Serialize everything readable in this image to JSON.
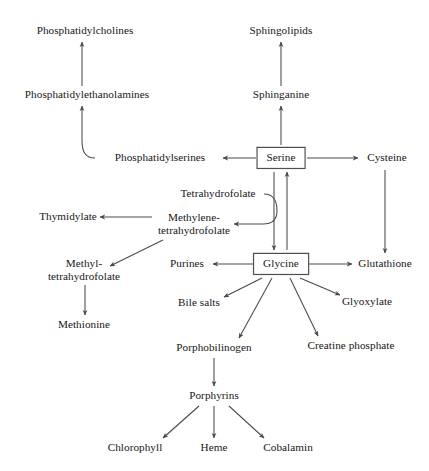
{
  "diagram": {
    "type": "flowchart",
    "width": 429,
    "height": 471,
    "background_color": "#ffffff",
    "text_color": "#161616",
    "edge_color": "#4a4a4a",
    "box_border_color": "#3b3b3b",
    "nodes": [
      {
        "id": "phosphatidylcholines",
        "label": "Phosphatidylcholines",
        "x": 85,
        "y": 31,
        "boxed": false
      },
      {
        "id": "sphingolipids",
        "label": "Sphingolipids",
        "x": 281,
        "y": 31,
        "boxed": false
      },
      {
        "id": "phosphatidylethanolamines",
        "label": "Phosphatidylethanolamines",
        "x": 87,
        "y": 95,
        "boxed": false
      },
      {
        "id": "sphinganine",
        "label": "Sphinganine",
        "x": 281,
        "y": 95,
        "boxed": false
      },
      {
        "id": "phosphatidylserines",
        "label": "Phosphatidylserines",
        "x": 160,
        "y": 158,
        "boxed": false
      },
      {
        "id": "serine",
        "label": "Serine",
        "x": 281,
        "y": 158,
        "boxed": true
      },
      {
        "id": "cysteine",
        "label": "Cysteine",
        "x": 387,
        "y": 158,
        "boxed": false
      },
      {
        "id": "tetrahydrofolate",
        "label": "Tetrahydrofolate",
        "x": 218,
        "y": 194,
        "boxed": false
      },
      {
        "id": "thymidylate",
        "label": "Thymidylate",
        "x": 68,
        "y": 217,
        "boxed": false
      },
      {
        "id": "methylene-tetrahydrofolate",
        "label": "Methylene-",
        "label2": "tetrahydrofolate",
        "x": 194,
        "y": 224,
        "boxed": false
      },
      {
        "id": "methyl-tetrahydrofolate",
        "label": "Methyl-",
        "label2": "tetrahydrofolate",
        "x": 84,
        "y": 270,
        "boxed": false
      },
      {
        "id": "purines",
        "label": "Purines",
        "x": 187,
        "y": 264,
        "boxed": false
      },
      {
        "id": "glycine",
        "label": "Glycine",
        "x": 281,
        "y": 264,
        "boxed": true
      },
      {
        "id": "glutathione",
        "label": "Glutathione",
        "x": 385,
        "y": 264,
        "boxed": false
      },
      {
        "id": "bile-salts",
        "label": "Bile salts",
        "x": 199,
        "y": 303,
        "boxed": false
      },
      {
        "id": "glyoxylate",
        "label": "Glyoxylate",
        "x": 367,
        "y": 302,
        "boxed": false
      },
      {
        "id": "creatine-phosphate",
        "label": "Creatine phosphate",
        "x": 351,
        "y": 346,
        "boxed": false
      },
      {
        "id": "methionine",
        "label": "Methionine",
        "x": 84,
        "y": 325,
        "boxed": false
      },
      {
        "id": "porphobilinogen",
        "label": "Porphobilinogen",
        "x": 214,
        "y": 348,
        "boxed": false
      },
      {
        "id": "porphyrins",
        "label": "Porphyrins",
        "x": 214,
        "y": 396,
        "boxed": false
      },
      {
        "id": "chlorophyll",
        "label": "Chlorophyll",
        "x": 135,
        "y": 448,
        "boxed": false
      },
      {
        "id": "heme",
        "label": "Heme",
        "x": 214,
        "y": 448,
        "boxed": false
      },
      {
        "id": "cobalamin",
        "label": "Cobalamin",
        "x": 288,
        "y": 448,
        "boxed": false
      }
    ],
    "edges": [
      {
        "from": "phosphatidylethanolamines",
        "to": "phosphatidylcholines",
        "kind": "straight"
      },
      {
        "from": "phosphatidylserines",
        "to": "phosphatidylethanolamines",
        "kind": "curved"
      },
      {
        "from": "serine",
        "to": "phosphatidylserines",
        "kind": "straight"
      },
      {
        "from": "serine",
        "to": "sphinganine",
        "kind": "straight"
      },
      {
        "from": "sphinganine",
        "to": "sphingolipids",
        "kind": "straight"
      },
      {
        "from": "serine",
        "to": "cysteine",
        "kind": "straight"
      },
      {
        "from": "cysteine",
        "to": "glutathione",
        "kind": "straight"
      },
      {
        "from": "serine",
        "to": "glycine",
        "kind": "straight"
      },
      {
        "from": "glycine",
        "to": "serine",
        "kind": "straight"
      },
      {
        "from": "tetrahydrofolate",
        "to": "methylene-tetrahydrofolate",
        "kind": "curved"
      },
      {
        "from": "methylene-tetrahydrofolate",
        "to": "thymidylate",
        "kind": "straight"
      },
      {
        "from": "methylene-tetrahydrofolate",
        "to": "methyl-tetrahydrofolate",
        "kind": "straight"
      },
      {
        "from": "methyl-tetrahydrofolate",
        "to": "methionine",
        "kind": "straight"
      },
      {
        "from": "glycine",
        "to": "purines",
        "kind": "straight"
      },
      {
        "from": "glycine",
        "to": "glutathione",
        "kind": "straight"
      },
      {
        "from": "glycine",
        "to": "bile-salts",
        "kind": "straight"
      },
      {
        "from": "glycine",
        "to": "porphobilinogen",
        "kind": "straight"
      },
      {
        "from": "glycine",
        "to": "creatine-phosphate",
        "kind": "straight"
      },
      {
        "from": "glycine",
        "to": "glyoxylate",
        "kind": "straight"
      },
      {
        "from": "porphobilinogen",
        "to": "porphyrins",
        "kind": "straight"
      },
      {
        "from": "porphyrins",
        "to": "chlorophyll",
        "kind": "straight"
      },
      {
        "from": "porphyrins",
        "to": "heme",
        "kind": "straight"
      },
      {
        "from": "porphyrins",
        "to": "cobalamin",
        "kind": "straight"
      }
    ]
  }
}
